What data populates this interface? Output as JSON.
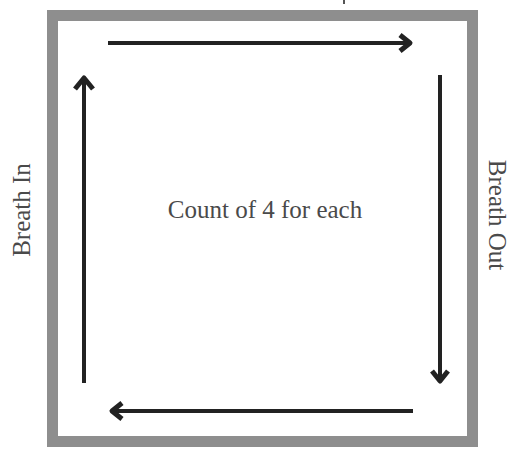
{
  "diagram": {
    "center_text": "Count of 4 for each",
    "left_label": "Breath In",
    "right_label": "Breath Out",
    "colors": {
      "border": "#8e8e8e",
      "arrow": "#222222",
      "text": "#4a4a4a",
      "background": "#ffffff"
    },
    "arrows": [
      {
        "id": "left",
        "direction": "up",
        "label": "Breath In"
      },
      {
        "id": "top",
        "direction": "right",
        "label": ""
      },
      {
        "id": "right",
        "direction": "down",
        "label": "Breath Out"
      },
      {
        "id": "bottom",
        "direction": "left",
        "label": ""
      }
    ]
  }
}
